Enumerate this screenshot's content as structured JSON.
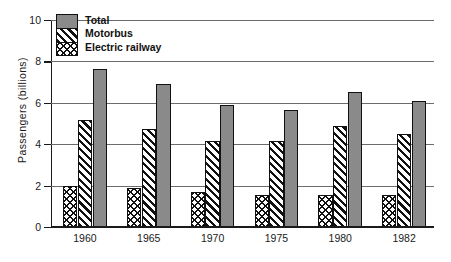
{
  "chart_data": {
    "type": "bar",
    "title": "",
    "xlabel": "",
    "ylabel": "Passengers (billions)",
    "ylim": [
      0,
      10
    ],
    "yticks": [
      0,
      2,
      4,
      6,
      8,
      10
    ],
    "ytick_labels": [
      "0",
      "2",
      "4",
      "6",
      "8",
      "10"
    ],
    "grid": true,
    "legend_position": "top-left",
    "categories": [
      "1960",
      "1965",
      "1970",
      "1975",
      "1980",
      "1982"
    ],
    "series": [
      {
        "name": "Electric railway",
        "pattern": "diamond-lattice",
        "values": [
          2.0,
          1.9,
          1.7,
          1.55,
          1.55,
          1.55
        ]
      },
      {
        "name": "Motorbus",
        "pattern": "diagonal-hatch",
        "values": [
          5.15,
          4.75,
          4.15,
          4.15,
          4.9,
          4.5
        ]
      },
      {
        "name": "Total",
        "pattern": "solid-gray",
        "values": [
          7.65,
          6.9,
          5.9,
          5.65,
          6.5,
          6.1
        ]
      }
    ],
    "colors": {
      "total_fill": "#8a8a8a",
      "pattern_ink": "#111111",
      "pattern_ground": "#ffffff",
      "axis": "#1a1a1a",
      "gridline": "#6b6b6b",
      "background": "#ffffff"
    }
  },
  "legend": {
    "entries": [
      {
        "label": "Total"
      },
      {
        "label": "Motorbus"
      },
      {
        "label": "Electric railway"
      }
    ]
  }
}
